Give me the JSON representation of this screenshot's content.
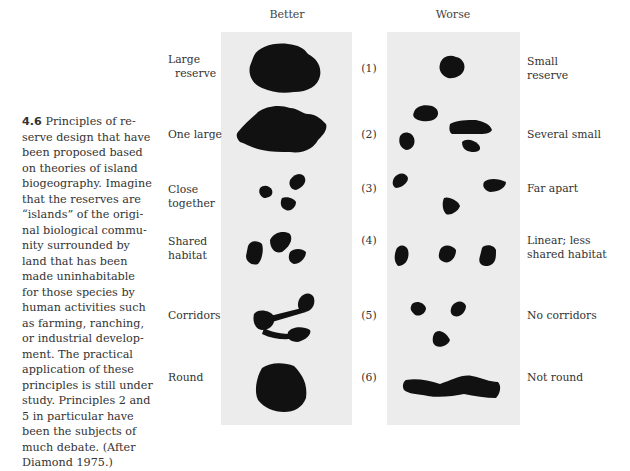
{
  "figure": {
    "number": "4.6",
    "caption": "Principles of re-serve design that have been proposed based on theories of island biogeography. Imagine that the reserves are “islands” of the original biological community surrounded by land that has been made uninhabitable for those species by human activities such as farming, ranching, or industrial development. The practical application of these principles is still under study. Principles 2 and 5 in particular have been the subjects of much debate. (After Diamond 1975.)",
    "caption_lines": [
      "Principles of re-",
      "serve design that have",
      "been proposed based",
      "on theories of island",
      "biogeography. Imagine",
      "that the reserves are",
      "“islands” of the origi-",
      "nal biological commu-",
      "nity surrounded by",
      "land that has been",
      "made uninhabitable",
      "for those species by",
      "human activities such",
      "as farming, ranching,",
      "or industrial develop-",
      "ment. The practical",
      "application of these",
      "principles is still under",
      "study. Principles 2 and",
      "5 in particular have",
      "been the subjects of",
      "much debate. (After",
      "Diamond 1975.)"
    ]
  },
  "columns": {
    "better": "Better",
    "worse": "Worse"
  },
  "principles": [
    {
      "number": "(1)",
      "better": [
        "Large",
        "reserve"
      ],
      "worse": [
        "Small",
        "reserve"
      ]
    },
    {
      "number": "(2)",
      "better": [
        "One large"
      ],
      "worse": [
        "Several small"
      ]
    },
    {
      "number": "(3)",
      "better": [
        "Close",
        "together"
      ],
      "worse": [
        "Far apart"
      ]
    },
    {
      "number": "(4)",
      "better": [
        "Shared",
        "habitat"
      ],
      "worse": [
        "Linear; less",
        "shared habitat"
      ]
    },
    {
      "number": "(5)",
      "better": [
        "Corridors"
      ],
      "worse": [
        "No corridors"
      ]
    },
    {
      "number": "(6)",
      "better": [
        "Round"
      ],
      "worse": [
        "Not round"
      ]
    }
  ],
  "colors": {
    "panel": "#ececec",
    "shape": "#111111",
    "text": "#333333"
  }
}
